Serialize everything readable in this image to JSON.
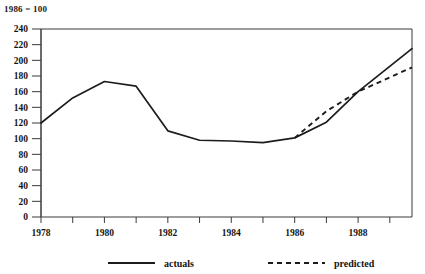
{
  "header": {
    "index_note": "1986 = 100",
    "clipped_top_text": "y"
  },
  "legend": {
    "position": "bottom",
    "entries": [
      {
        "label": "actuals",
        "style": "solid"
      },
      {
        "label": "predicted",
        "style": "dashed"
      }
    ]
  },
  "chart_data": {
    "type": "line",
    "title": "",
    "subtitle": "1986 = 100",
    "xlabel": "",
    "ylabel": "",
    "xlim": [
      1978,
      1989.7
    ],
    "ylim": [
      0,
      240
    ],
    "grid": false,
    "y_ticks": [
      0,
      20,
      40,
      60,
      80,
      100,
      120,
      140,
      160,
      180,
      200,
      220,
      240
    ],
    "y_tick_labels": [
      "0",
      "20",
      "40",
      "60",
      "80",
      "100",
      "120",
      "140",
      "160",
      "180",
      "200",
      "220",
      "240"
    ],
    "x_ticks": [
      1978,
      1979,
      1980,
      1981,
      1982,
      1983,
      1984,
      1985,
      1986,
      1987,
      1988,
      1989
    ],
    "x_tick_labels": [
      "1978",
      "",
      "1980",
      "",
      "1982",
      "",
      "1984",
      "",
      "1986",
      "",
      "1988",
      ""
    ],
    "x_labeled_ticks": [
      1978,
      1980,
      1982,
      1984,
      1986,
      1988
    ],
    "series": [
      {
        "name": "actuals",
        "style": "solid",
        "x": [
          1978,
          1979,
          1980,
          1981,
          1982,
          1983,
          1984,
          1985,
          1986,
          1987,
          1988,
          1989.7
        ],
        "values": [
          120,
          152,
          173,
          167,
          110,
          98,
          97,
          95,
          101,
          121,
          160,
          215
        ]
      },
      {
        "name": "predicted",
        "style": "dashed",
        "x": [
          1986,
          1987,
          1988,
          1989.7
        ],
        "values": [
          101,
          135,
          160,
          191
        ]
      }
    ]
  },
  "colors": {
    "line": "#1c1c1c",
    "axis": "#3a3a3a",
    "background": "#ffffff",
    "text": "#141414"
  }
}
